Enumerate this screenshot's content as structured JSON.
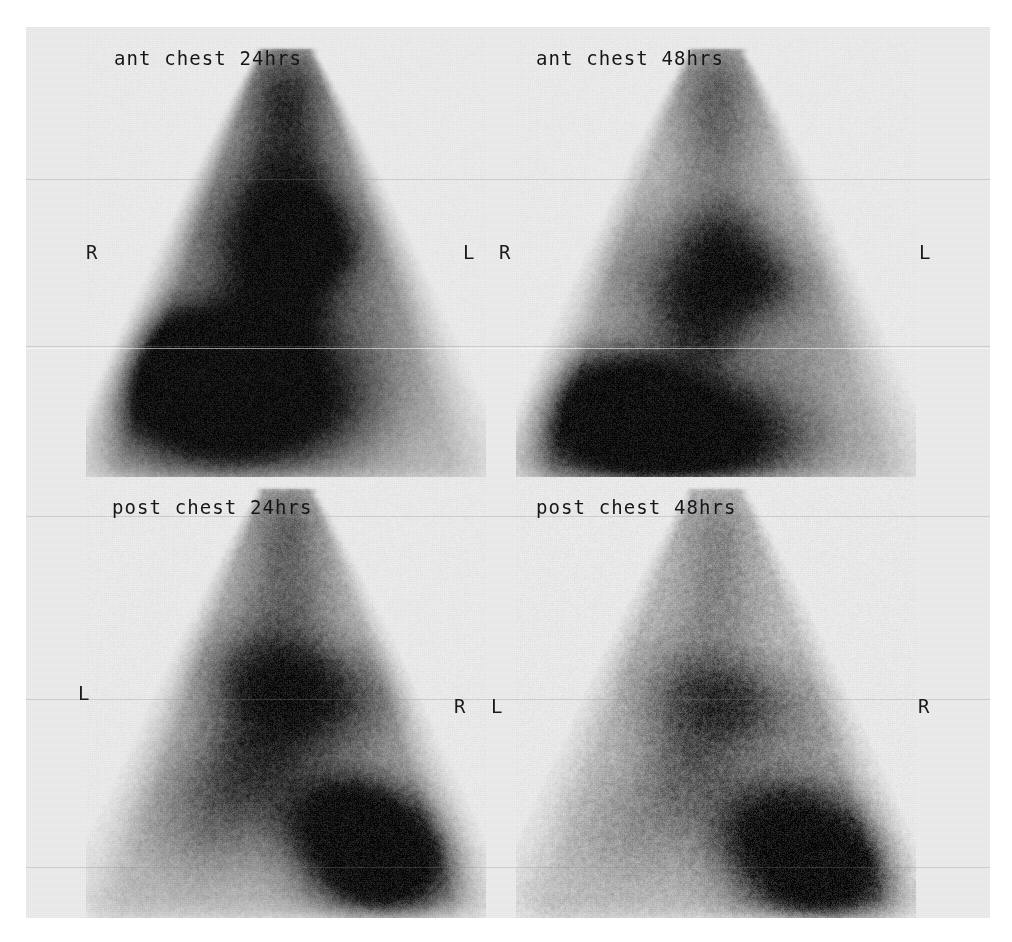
{
  "document": {
    "kind": "nuclear-medicine-scintigraphy-contact-sheet",
    "background_color": "#ffffff",
    "sheet_color": "#ededee",
    "label_color": "#16161a"
  },
  "panels": [
    {
      "id": "ant-chest-24hrs",
      "label": "ant chest 24hrs",
      "view": "anterior",
      "timepoint": "24hrs",
      "left_marker": "R",
      "right_marker": "L",
      "hotspot_side": "image-left",
      "intensity": "high"
    },
    {
      "id": "ant-chest-48hrs",
      "label": "ant chest 48hrs",
      "view": "anterior",
      "timepoint": "48hrs",
      "left_marker": "R",
      "right_marker": "L",
      "hotspot_side": "image-left",
      "intensity": "medium"
    },
    {
      "id": "post-chest-24hrs",
      "label": "post chest 24hrs",
      "view": "posterior",
      "timepoint": "24hrs",
      "left_marker": "L",
      "right_marker": "R",
      "hotspot_side": "image-right",
      "intensity": "medium-high"
    },
    {
      "id": "post-chest-48hrs",
      "label": "post chest 48hrs",
      "view": "posterior",
      "timepoint": "48hrs",
      "left_marker": "L",
      "right_marker": "R",
      "hotspot_side": "image-right",
      "intensity": "low"
    }
  ],
  "markers": {
    "row_top": {
      "far_left": "R",
      "center_left": "L",
      "center_right": "R",
      "far_right": "L"
    },
    "row_bottom": {
      "far_left": "L",
      "center_left": "R",
      "center_right": "L",
      "far_right": "R"
    }
  },
  "render": {
    "panel_geometry": [
      {
        "x": 60,
        "y": 10,
        "w": 400,
        "h": 450
      },
      {
        "x": 490,
        "y": 10,
        "w": 400,
        "h": 450
      },
      {
        "x": 60,
        "y": 450,
        "w": 400,
        "h": 445
      },
      {
        "x": 490,
        "y": 450,
        "w": 400,
        "h": 445
      }
    ],
    "body_shape": {
      "apex_y_frac": 0.04,
      "apex_half_width_frac": 0.07,
      "base_y_frac": 0.94,
      "base_half_width_frac": 0.5
    },
    "blobs": [
      {
        "panel": 0,
        "items": [
          {
            "cx": 0.5,
            "cy": 0.1,
            "rx": 0.1,
            "ry": 0.1,
            "a": 0.46
          },
          {
            "cx": 0.5,
            "cy": 0.22,
            "rx": 0.13,
            "ry": 0.12,
            "a": 0.4
          },
          {
            "cx": 0.5,
            "cy": 0.38,
            "rx": 0.14,
            "ry": 0.13,
            "a": 0.72
          },
          {
            "cx": 0.56,
            "cy": 0.46,
            "rx": 0.12,
            "ry": 0.09,
            "a": 0.62
          },
          {
            "cx": 0.47,
            "cy": 0.52,
            "rx": 0.13,
            "ry": 0.12,
            "a": 0.55
          },
          {
            "cx": 0.49,
            "cy": 0.62,
            "rx": 0.1,
            "ry": 0.1,
            "a": 0.4
          },
          {
            "cx": 0.33,
            "cy": 0.76,
            "rx": 0.26,
            "ry": 0.15,
            "a": 0.95
          },
          {
            "cx": 0.4,
            "cy": 0.83,
            "rx": 0.28,
            "ry": 0.13,
            "a": 0.88
          },
          {
            "cx": 0.28,
            "cy": 0.72,
            "rx": 0.16,
            "ry": 0.1,
            "a": 0.8
          },
          {
            "cx": 0.68,
            "cy": 0.6,
            "rx": 0.16,
            "ry": 0.18,
            "a": 0.26
          },
          {
            "cx": 0.3,
            "cy": 0.45,
            "rx": 0.14,
            "ry": 0.16,
            "a": 0.24
          }
        ]
      },
      {
        "panel": 1,
        "items": [
          {
            "cx": 0.5,
            "cy": 0.1,
            "rx": 0.09,
            "ry": 0.1,
            "a": 0.34
          },
          {
            "cx": 0.5,
            "cy": 0.24,
            "rx": 0.11,
            "ry": 0.12,
            "a": 0.3
          },
          {
            "cx": 0.51,
            "cy": 0.45,
            "rx": 0.12,
            "ry": 0.1,
            "a": 0.58
          },
          {
            "cx": 0.58,
            "cy": 0.54,
            "rx": 0.13,
            "ry": 0.08,
            "a": 0.5
          },
          {
            "cx": 0.45,
            "cy": 0.58,
            "rx": 0.13,
            "ry": 0.1,
            "a": 0.46
          },
          {
            "cx": 0.47,
            "cy": 0.66,
            "rx": 0.1,
            "ry": 0.08,
            "a": 0.32
          },
          {
            "cx": 0.33,
            "cy": 0.85,
            "rx": 0.27,
            "ry": 0.13,
            "a": 0.92
          },
          {
            "cx": 0.42,
            "cy": 0.9,
            "rx": 0.28,
            "ry": 0.1,
            "a": 0.82
          },
          {
            "cx": 0.26,
            "cy": 0.8,
            "rx": 0.15,
            "ry": 0.09,
            "a": 0.66
          },
          {
            "cx": 0.68,
            "cy": 0.65,
            "rx": 0.16,
            "ry": 0.16,
            "a": 0.2
          },
          {
            "cx": 0.3,
            "cy": 0.52,
            "rx": 0.14,
            "ry": 0.14,
            "a": 0.2
          }
        ]
      },
      {
        "panel": 2,
        "items": [
          {
            "cx": 0.5,
            "cy": 0.1,
            "rx": 0.09,
            "ry": 0.1,
            "a": 0.34
          },
          {
            "cx": 0.5,
            "cy": 0.26,
            "rx": 0.12,
            "ry": 0.12,
            "a": 0.36
          },
          {
            "cx": 0.44,
            "cy": 0.44,
            "rx": 0.15,
            "ry": 0.11,
            "a": 0.54
          },
          {
            "cx": 0.55,
            "cy": 0.48,
            "rx": 0.14,
            "ry": 0.1,
            "a": 0.46
          },
          {
            "cx": 0.47,
            "cy": 0.58,
            "rx": 0.16,
            "ry": 0.12,
            "a": 0.42
          },
          {
            "cx": 0.4,
            "cy": 0.68,
            "rx": 0.16,
            "ry": 0.12,
            "a": 0.34
          },
          {
            "cx": 0.7,
            "cy": 0.82,
            "rx": 0.17,
            "ry": 0.12,
            "a": 0.95
          },
          {
            "cx": 0.76,
            "cy": 0.88,
            "rx": 0.14,
            "ry": 0.1,
            "a": 0.88
          },
          {
            "cx": 0.64,
            "cy": 0.76,
            "rx": 0.12,
            "ry": 0.08,
            "a": 0.62
          },
          {
            "cx": 0.3,
            "cy": 0.78,
            "rx": 0.16,
            "ry": 0.13,
            "a": 0.26
          },
          {
            "cx": 0.7,
            "cy": 0.52,
            "rx": 0.14,
            "ry": 0.13,
            "a": 0.26
          }
        ]
      },
      {
        "panel": 3,
        "items": [
          {
            "cx": 0.5,
            "cy": 0.12,
            "rx": 0.08,
            "ry": 0.09,
            "a": 0.22
          },
          {
            "cx": 0.5,
            "cy": 0.28,
            "rx": 0.11,
            "ry": 0.12,
            "a": 0.24
          },
          {
            "cx": 0.44,
            "cy": 0.48,
            "rx": 0.14,
            "ry": 0.11,
            "a": 0.4
          },
          {
            "cx": 0.56,
            "cy": 0.5,
            "rx": 0.12,
            "ry": 0.09,
            "a": 0.32
          },
          {
            "cx": 0.47,
            "cy": 0.6,
            "rx": 0.14,
            "ry": 0.11,
            "a": 0.26
          },
          {
            "cx": 0.42,
            "cy": 0.7,
            "rx": 0.14,
            "ry": 0.11,
            "a": 0.22
          },
          {
            "cx": 0.72,
            "cy": 0.84,
            "rx": 0.18,
            "ry": 0.13,
            "a": 0.88
          },
          {
            "cx": 0.78,
            "cy": 0.9,
            "rx": 0.14,
            "ry": 0.1,
            "a": 0.78
          },
          {
            "cx": 0.64,
            "cy": 0.78,
            "rx": 0.13,
            "ry": 0.09,
            "a": 0.52
          },
          {
            "cx": 0.3,
            "cy": 0.8,
            "rx": 0.15,
            "ry": 0.12,
            "a": 0.16
          },
          {
            "cx": 0.7,
            "cy": 0.56,
            "rx": 0.13,
            "ry": 0.12,
            "a": 0.18
          }
        ]
      }
    ],
    "noise": [
      {
        "panel": 0,
        "amount": 0.4,
        "grain": 2
      },
      {
        "panel": 1,
        "amount": 0.46,
        "grain": 2
      },
      {
        "panel": 2,
        "amount": 0.5,
        "grain": 2
      },
      {
        "panel": 3,
        "amount": 0.62,
        "grain": 2
      }
    ],
    "scanlines_y": [
      152,
      319,
      489,
      672,
      840
    ]
  }
}
